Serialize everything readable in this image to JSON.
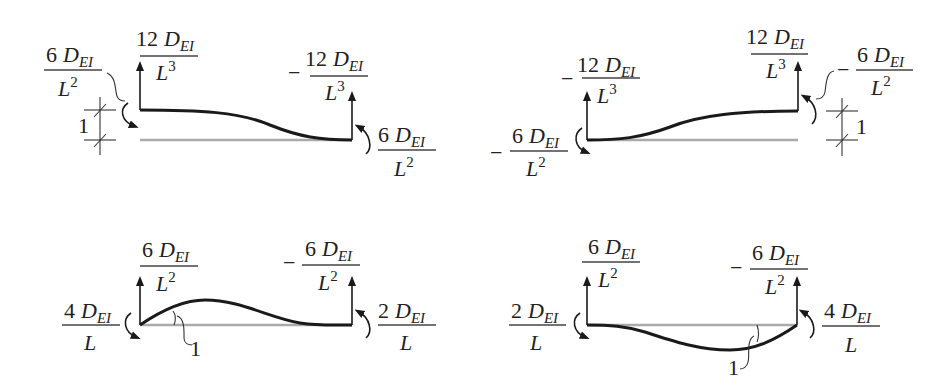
{
  "diagram": {
    "panels": [
      {
        "id": "panel-1",
        "description": "unit translation at left end",
        "left_force": {
          "sign": "",
          "coef": "12",
          "sym": "D",
          "subscript": "EI",
          "den": "L",
          "power": "3"
        },
        "right_force": {
          "sign": "−",
          "coef": "12",
          "sym": "D",
          "subscript": "EI",
          "den": "L",
          "power": "3"
        },
        "left_moment": {
          "sign": "",
          "coef": "6",
          "sym": "D",
          "subscript": "EI",
          "den": "L",
          "power": "2"
        },
        "right_moment": {
          "sign": "",
          "coef": "6",
          "sym": "D",
          "subscript": "EI",
          "den": "L",
          "power": "2"
        },
        "unit_label": "1"
      },
      {
        "id": "panel-2",
        "description": "unit translation at right end",
        "left_force": {
          "sign": "−",
          "coef": "12",
          "sym": "D",
          "subscript": "EI",
          "den": "L",
          "power": "3"
        },
        "right_force": {
          "sign": "",
          "coef": "12",
          "sym": "D",
          "subscript": "EI",
          "den": "L",
          "power": "3"
        },
        "left_moment": {
          "sign": "−",
          "coef": "6",
          "sym": "D",
          "subscript": "EI",
          "den": "L",
          "power": "2"
        },
        "right_moment": {
          "sign": "−",
          "coef": "6",
          "sym": "D",
          "subscript": "EI",
          "den": "L",
          "power": "2"
        },
        "unit_label": "1"
      },
      {
        "id": "panel-3",
        "description": "unit rotation at left end",
        "left_force": {
          "sign": "",
          "coef": "6",
          "sym": "D",
          "subscript": "EI",
          "den": "L",
          "power": "2"
        },
        "right_force": {
          "sign": "−",
          "coef": "6",
          "sym": "D",
          "subscript": "EI",
          "den": "L",
          "power": "2"
        },
        "left_moment": {
          "sign": "",
          "coef": "4",
          "sym": "D",
          "subscript": "EI",
          "den": "L",
          "power": ""
        },
        "right_moment": {
          "sign": "",
          "coef": "2",
          "sym": "D",
          "subscript": "EI",
          "den": "L",
          "power": ""
        },
        "unit_label": "1"
      },
      {
        "id": "panel-4",
        "description": "unit rotation at right end",
        "left_force": {
          "sign": "",
          "coef": "6",
          "sym": "D",
          "subscript": "EI",
          "den": "L",
          "power": "2"
        },
        "right_force": {
          "sign": "−",
          "coef": "6",
          "sym": "D",
          "subscript": "EI",
          "den": "L",
          "power": "2"
        },
        "left_moment": {
          "sign": "",
          "coef": "2",
          "sym": "D",
          "subscript": "EI",
          "den": "L",
          "power": ""
        },
        "right_moment": {
          "sign": "",
          "coef": "4",
          "sym": "D",
          "subscript": "EI",
          "den": "L",
          "power": ""
        },
        "unit_label": "1"
      }
    ],
    "colors": {
      "deflected_beam": "#1a1a1a",
      "undeformed_beam": "#aaaaaa",
      "text": "#222222"
    }
  }
}
